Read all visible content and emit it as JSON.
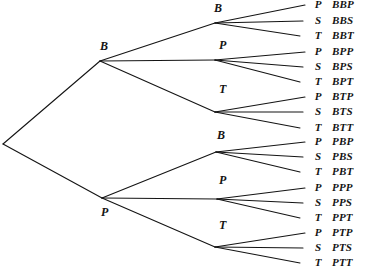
{
  "figure": {
    "type": "probability-tree-diagram",
    "width": 371,
    "height": 267,
    "background_color": "#ffffff",
    "line_color": "#141414",
    "text_color": "#141414",
    "levels": 3,
    "branch_factor": 3,
    "leaf_count": 18
  },
  "root": {
    "x": 3,
    "y": 144,
    "label": ""
  },
  "level1": [
    {
      "id": "B",
      "label": "B",
      "x": 100,
      "y": 61,
      "label_x": 100,
      "label_y": 40
    },
    {
      "id": "P",
      "label": "P",
      "x": 102,
      "y": 198,
      "label_x": 101,
      "label_y": 206
    }
  ],
  "level2": [
    {
      "id": "BB",
      "label": "B",
      "parent": "B",
      "x": 215,
      "y": 23,
      "label_x": 214,
      "label_y": 2
    },
    {
      "id": "BP",
      "label": "P",
      "parent": "B",
      "x": 215,
      "y": 60,
      "label_x": 219,
      "label_y": 39
    },
    {
      "id": "BT",
      "label": "T",
      "parent": "B",
      "x": 215,
      "y": 112,
      "label_x": 219,
      "label_y": 83
    },
    {
      "id": "PB",
      "label": "B",
      "parent": "P",
      "x": 216,
      "y": 152,
      "label_x": 217,
      "label_y": 129
    },
    {
      "id": "PP",
      "label": "P",
      "parent": "P",
      "x": 217,
      "y": 199,
      "label_x": 219,
      "label_y": 174
    },
    {
      "id": "PT",
      "label": "T",
      "parent": "P",
      "x": 215,
      "y": 247,
      "label_x": 219,
      "label_y": 219
    }
  ],
  "leaves": [
    {
      "letter": "P",
      "outcome": "BBP",
      "parent": "BB",
      "y": 5,
      "x_end": 305
    },
    {
      "letter": "S",
      "outcome": "BBS",
      "parent": "BB",
      "y": 21,
      "x_end": 303
    },
    {
      "letter": "T",
      "outcome": "BBT",
      "parent": "BB",
      "y": 36,
      "x_end": 300
    },
    {
      "letter": "P",
      "outcome": "BPP",
      "parent": "BP",
      "y": 52,
      "x_end": 305
    },
    {
      "letter": "S",
      "outcome": "BPS",
      "parent": "BP",
      "y": 67,
      "x_end": 303
    },
    {
      "letter": "T",
      "outcome": "BPT",
      "parent": "BP",
      "y": 82,
      "x_end": 300
    },
    {
      "letter": "P",
      "outcome": "BTP",
      "parent": "BT",
      "y": 97,
      "x_end": 305
    },
    {
      "letter": "S",
      "outcome": "BTS",
      "parent": "BT",
      "y": 112,
      "x_end": 303
    },
    {
      "letter": "T",
      "outcome": "BTT",
      "parent": "BT",
      "y": 128,
      "x_end": 300
    },
    {
      "letter": "P",
      "outcome": "PBP",
      "parent": "PB",
      "y": 142,
      "x_end": 305
    },
    {
      "letter": "S",
      "outcome": "PBS",
      "parent": "PB",
      "y": 157,
      "x_end": 303
    },
    {
      "letter": "T",
      "outcome": "PBT",
      "parent": "PB",
      "y": 172,
      "x_end": 300
    },
    {
      "letter": "P",
      "outcome": "PPP",
      "parent": "PP",
      "y": 188,
      "x_end": 305
    },
    {
      "letter": "S",
      "outcome": "PPS",
      "parent": "PP",
      "y": 203,
      "x_end": 303
    },
    {
      "letter": "T",
      "outcome": "PPT",
      "parent": "PP",
      "y": 218,
      "x_end": 300
    },
    {
      "letter": "P",
      "outcome": "PTP",
      "parent": "PT",
      "y": 233,
      "x_end": 305
    },
    {
      "letter": "S",
      "outcome": "PTS",
      "parent": "PT",
      "y": 248,
      "x_end": 303
    },
    {
      "letter": "T",
      "outcome": "PTT",
      "parent": "PT",
      "y": 263,
      "x_end": 300
    }
  ],
  "columns": {
    "leaf_letter_x": 311,
    "outcome_x": 332
  }
}
